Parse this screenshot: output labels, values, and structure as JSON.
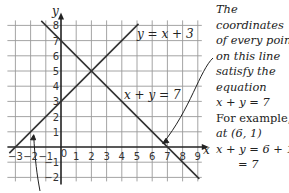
{
  "chart_data": {
    "type": "line",
    "title": "",
    "xlabel": "x",
    "ylabel": "y",
    "xlim": [
      -3,
      9
    ],
    "ylim": [
      -2,
      8
    ],
    "grid": true,
    "x_ticks": [
      "-3",
      "-2",
      "-1",
      "0",
      "1",
      "2",
      "3",
      "4",
      "5",
      "6",
      "7",
      "8",
      "9"
    ],
    "y_ticks": [
      "-2",
      "-1",
      "1",
      "2",
      "3",
      "4",
      "5",
      "6",
      "7",
      "8"
    ],
    "series": [
      {
        "name": "y = x + 3",
        "points": [
          [
            -3,
            0
          ],
          [
            0,
            3
          ],
          [
            2,
            5
          ],
          [
            5,
            8
          ]
        ]
      },
      {
        "name": "x + y = 7",
        "points": [
          [
            -1,
            8
          ],
          [
            0,
            7
          ],
          [
            2,
            5
          ],
          [
            7,
            0
          ],
          [
            9,
            -2
          ]
        ]
      }
    ],
    "intersection": [
      2,
      5
    ],
    "annotations": [
      {
        "text": "y = x + 3",
        "near": [
          5.2,
          7
        ]
      },
      {
        "text": "x + y = 7",
        "near": [
          3.5,
          3.5
        ]
      }
    ]
  },
  "labels": {
    "y_axis": "y",
    "x_axis": "x",
    "line1": "y = x + 3",
    "line2": "x + y = 7"
  },
  "note": {
    "lines": [
      "The",
      "coordinates",
      "of every point",
      "on this line",
      "satisfy the",
      "equation",
      "x + y = 7",
      "For example,",
      "at (6, 1)",
      "x + y = 6 + 1",
      "= 7"
    ]
  }
}
